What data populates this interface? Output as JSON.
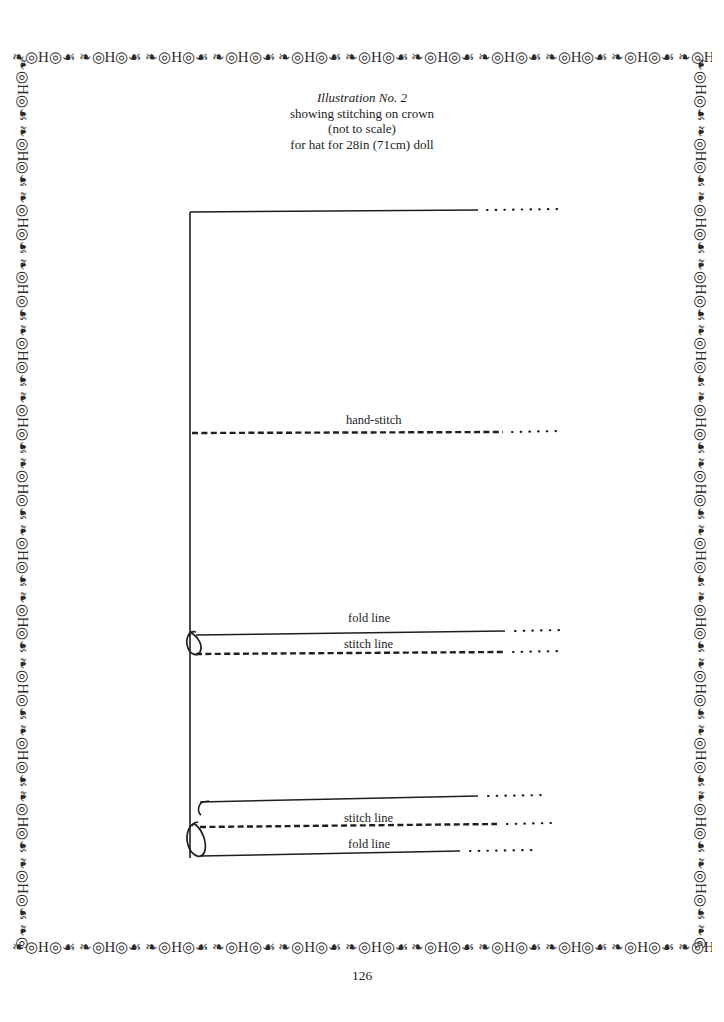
{
  "page": {
    "number": "126",
    "background_color": "#ffffff",
    "ink_color": "#1a1a1a"
  },
  "border": {
    "motif": "ornamental-scroll-repeat",
    "motif_glyphs": "❧◎H◎☙  ❧◎H◎☙  ❧◎H◎☙  ❧◎H◎☙  ❧◎H◎☙  ❧◎H◎☙  ❧◎H◎☙  ❧◎H◎☙  ❧◎H◎☙  ❧◎H◎☙  ❧◎H◎☙  ❧◎H◎☙  ❧◎H◎☙  ❧◎H◎☙  ❧◎H◎☙  ❧◎H◎☙  ❧◎H◎☙  ❧◎H◎☙",
    "motif_glyphs_long": "❧◎H◎☙  ❧◎H◎☙  ❧◎H◎☙  ❧◎H◎☙  ❧◎H◎☙  ❧◎H◎☙  ❧◎H◎☙  ❧◎H◎☙  ❧◎H◎☙  ❧◎H◎☙  ❧◎H◎☙  ❧◎H◎☙  ❧◎H◎☙  ❧◎H◎☙  ❧◎H◎☙  ❧◎H◎☙  ❧◎H◎☙  ❧◎H◎☙  ❧◎H◎☙  ❧◎H◎☙  ❧◎H◎☙  ❧◎H◎☙  ❧◎H◎☙"
  },
  "caption": {
    "line1": "Illustration No. 2",
    "line2": "showing stitching on crown",
    "line3": "(not to scale)",
    "line4": "for hat for 28in (71cm) doll"
  },
  "diagram": {
    "labels": {
      "hand_stitch": "hand-stitch",
      "fold_line_upper": "fold line",
      "stitch_line_upper": "stitch line",
      "stitch_line_lower": "stitch line",
      "fold_line_lower": "fold line"
    }
  }
}
